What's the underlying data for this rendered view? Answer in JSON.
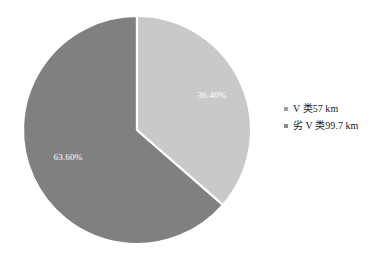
{
  "chart_data": {
    "type": "pie",
    "title": "",
    "categories": [
      "V 类57 km",
      "劣 V 类99.7 km"
    ],
    "values": [
      36.4,
      63.6
    ],
    "value_labels": [
      "36.40%",
      "63.60%"
    ],
    "colors": [
      "#c9c9c9",
      "#808080"
    ],
    "units": "%",
    "legend_position": "right",
    "start_angle_deg": 0,
    "direction": "clockwise",
    "slices": [
      {
        "name": "V 类57 km",
        "label": "36.40%",
        "percent": 36.4,
        "color": "#c9c9c9",
        "length_km": 57,
        "start_deg": 0,
        "end_deg": 131.04
      },
      {
        "name": "劣 V 类99.7 km",
        "label": "63.60%",
        "percent": 63.6,
        "color": "#808080",
        "length_km": 99.7,
        "start_deg": 131.04,
        "end_deg": 360
      }
    ]
  },
  "legend": {
    "items": [
      {
        "label": "V 类57 km",
        "color": "#9e9e9e"
      },
      {
        "label": "劣 V 类99.7 km",
        "color": "#8a8a8a"
      }
    ]
  },
  "pie_geometry": {
    "cx": 137,
    "cy": 130,
    "r": 114,
    "separator_color": "#ffffff",
    "separator_width": 2.2
  }
}
